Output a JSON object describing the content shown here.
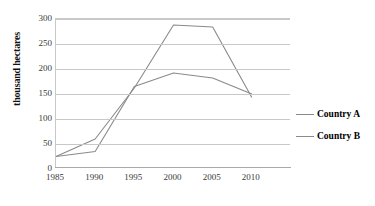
{
  "chart_data": {
    "type": "line",
    "title": "",
    "xlabel": "",
    "ylabel": "thousand hectares",
    "x": [
      1985,
      1990,
      1995,
      2000,
      2005,
      2010
    ],
    "xticklabels": [
      "1985",
      "1990",
      "1995",
      "2000",
      "2005",
      "2010"
    ],
    "yticklabels": [
      "0",
      "50",
      "100",
      "150",
      "200",
      "250",
      "300"
    ],
    "yticks": [
      0,
      50,
      100,
      150,
      200,
      250,
      300
    ],
    "ylim": [
      0,
      300
    ],
    "xlim": [
      1985,
      2010
    ],
    "grid": "horizontal",
    "legend_position": "right",
    "series": [
      {
        "name": "Country A",
        "color": "#8a8a8a",
        "values": [
          25,
          60,
          162,
          288,
          284,
          143
        ]
      },
      {
        "name": "Country B",
        "color": "#8a8a8a",
        "values": [
          25,
          35,
          165,
          192,
          182,
          150
        ]
      }
    ]
  },
  "legend": {
    "items": [
      {
        "label": "Country A"
      },
      {
        "label": "Country B"
      }
    ]
  },
  "axes": {
    "y_title": "thousand hectares"
  }
}
